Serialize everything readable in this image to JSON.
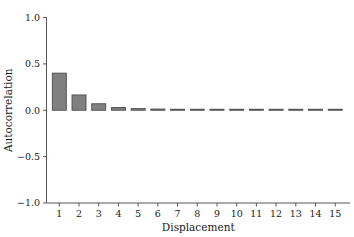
{
  "chart_data": {
    "type": "bar",
    "title": "",
    "xlabel": "Displacement",
    "ylabel": "Autocorrelation",
    "categories": [
      "1",
      "2",
      "3",
      "4",
      "5",
      "6",
      "7",
      "8",
      "9",
      "10",
      "11",
      "12",
      "13",
      "14",
      "15"
    ],
    "values": [
      0.4,
      0.165,
      0.07,
      0.03,
      0.018,
      0.013,
      0.01,
      0.009,
      0.008,
      0.007,
      0.006,
      0.006,
      0.005,
      0.005,
      0.005
    ],
    "series": [
      {
        "name": "Autocorrelation",
        "values": [
          0.4,
          0.165,
          0.07,
          0.03,
          0.018,
          0.013,
          0.01,
          0.009,
          0.008,
          0.007,
          0.006,
          0.006,
          0.005,
          0.005,
          0.005
        ]
      }
    ],
    "xlim": [
      0.35,
      15.75
    ],
    "ylim": [
      -1.0,
      1.0
    ],
    "ytick_labels": [
      "1.0",
      "0.5",
      "0.0",
      "−0.5",
      "−1.0"
    ],
    "ytick_values": [
      1.0,
      0.5,
      0.0,
      -0.5,
      -1.0
    ],
    "xtick_labels": [
      "1",
      "2",
      "3",
      "4",
      "5",
      "6",
      "7",
      "8",
      "9",
      "10",
      "11",
      "12",
      "13",
      "14",
      "15"
    ],
    "xtick_values": [
      1,
      2,
      3,
      4,
      5,
      6,
      7,
      8,
      9,
      10,
      11,
      12,
      13,
      14,
      15
    ],
    "grid": false,
    "legend": "none",
    "spines": "left-bottom",
    "tick_direction": "out",
    "bar_fill_color": "#808080",
    "bar_edge_color": "#4d4d4d",
    "axis_color": "#555555",
    "text_color": "#1a1a1a",
    "background_color": "#ffffff"
  }
}
